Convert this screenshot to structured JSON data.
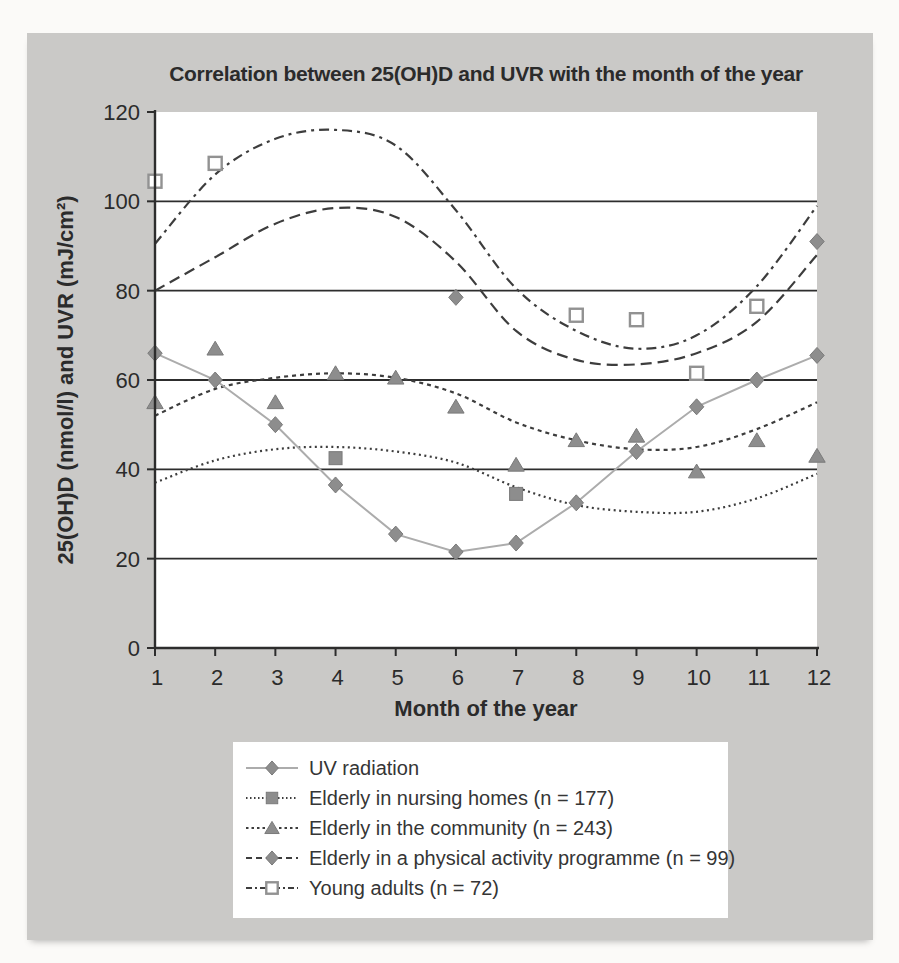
{
  "figure": {
    "title": "Correlation between 25(OH)D and UVR with the month of the year",
    "x_axis_label": "Month of the year",
    "y_axis_label": "25(OH)D (nmol/l) and UVR (mJ/cm²)"
  },
  "colors": {
    "panel_background": "#cac9c7",
    "plot_background": "#ffffff",
    "axis": "#2d2d2d",
    "gridline": "#2d2d2d",
    "fit_line": "#3d3d3d",
    "uv_line": "#acacac",
    "marker_fill": "#8d8d8d",
    "marker_stroke": "#7a7a7a",
    "open_marker_fill": "#ffffff",
    "open_marker_stroke": "#929292",
    "text": "#2b2b2b"
  },
  "chart_data": {
    "type": "line",
    "title": "Correlation between 25(OH)D and UVR with the month of the year",
    "xlabel": "Month of the year",
    "ylabel": "25(OH)D (nmol/l) and UVR (mJ/cm²)",
    "xlim": [
      1,
      12
    ],
    "ylim": [
      0,
      120
    ],
    "x_ticks": [
      1,
      2,
      3,
      4,
      5,
      6,
      7,
      8,
      9,
      10,
      11,
      12
    ],
    "y_ticks": [
      0,
      20,
      40,
      60,
      80,
      100,
      120
    ],
    "grid": "horizontal lines at 20, 40, 60, 80, 100",
    "legend_position": "below plot, boxed",
    "series": [
      {
        "name": "UV radiation",
        "marker": "filled-diamond",
        "line_style": "solid",
        "line_color_role": "uv_line",
        "draw": "straight line through points",
        "points_x": [
          1,
          2,
          3,
          4,
          5,
          6,
          7,
          8,
          9,
          10,
          11,
          12
        ],
        "points_y": [
          66,
          60,
          50,
          36.5,
          25.5,
          21.5,
          23.5,
          32.5,
          44,
          54,
          60,
          65.5
        ]
      },
      {
        "name": "Elderly in nursing homes (n = 177)",
        "marker": "filled-square",
        "line_style": "fine-dot",
        "line_color_role": "fit_line",
        "draw": "smooth fitted curve",
        "points_x": [
          4,
          7
        ],
        "points_y": [
          42.5,
          34.5
        ],
        "fit_x": [
          1,
          2,
          3,
          4,
          5,
          6,
          7,
          8,
          9,
          10,
          11,
          12
        ],
        "fit_values": [
          37,
          42,
          44.5,
          45,
          44,
          41.5,
          36,
          32,
          30.5,
          30.5,
          33.5,
          39
        ]
      },
      {
        "name": "Elderly in the community (n = 243)",
        "marker": "filled-triangle",
        "line_style": "dot",
        "line_color_role": "fit_line",
        "draw": "smooth fitted curve",
        "points_x": [
          1,
          2,
          3,
          4,
          5,
          6,
          7,
          8,
          9,
          10,
          11,
          12
        ],
        "points_y": [
          55,
          67,
          55,
          61.5,
          60.5,
          54,
          41,
          46.5,
          47.5,
          39.5,
          46.5,
          43
        ],
        "fit_x": [
          1,
          2,
          3,
          4,
          5,
          6,
          7,
          8,
          9,
          10,
          11,
          12
        ],
        "fit_values": [
          52,
          58,
          60.5,
          61.5,
          60.5,
          57,
          50.5,
          46.5,
          44.5,
          45,
          49,
          55
        ]
      },
      {
        "name": "Elderly in a physical activity programme (n = 99)",
        "marker": "filled-diamond",
        "line_style": "dash",
        "line_color_role": "fit_line",
        "draw": "smooth fitted curve",
        "points_x": [
          6,
          12
        ],
        "points_y": [
          78.5,
          91
        ],
        "fit_x": [
          1,
          2,
          3,
          4,
          5,
          6,
          7,
          8,
          9,
          10,
          11,
          12
        ],
        "fit_values": [
          80,
          87.5,
          95,
          98.5,
          96.5,
          86.5,
          71,
          64.5,
          63.5,
          66,
          73,
          88
        ]
      },
      {
        "name": "Young adults (n = 72)",
        "marker": "open-square",
        "line_style": "dash-dot",
        "line_color_role": "fit_line",
        "draw": "smooth fitted curve",
        "points_x": [
          1,
          2,
          8,
          9,
          10,
          11
        ],
        "points_y": [
          104.5,
          108.5,
          74.5,
          73.5,
          61.5,
          76.5
        ],
        "fit_x": [
          1,
          2,
          3,
          4,
          5,
          6,
          7,
          8,
          9,
          10,
          11,
          12
        ],
        "fit_values": [
          90.5,
          106,
          114,
          116,
          112.5,
          98,
          80.5,
          71,
          67,
          70,
          81,
          99
        ]
      }
    ]
  }
}
